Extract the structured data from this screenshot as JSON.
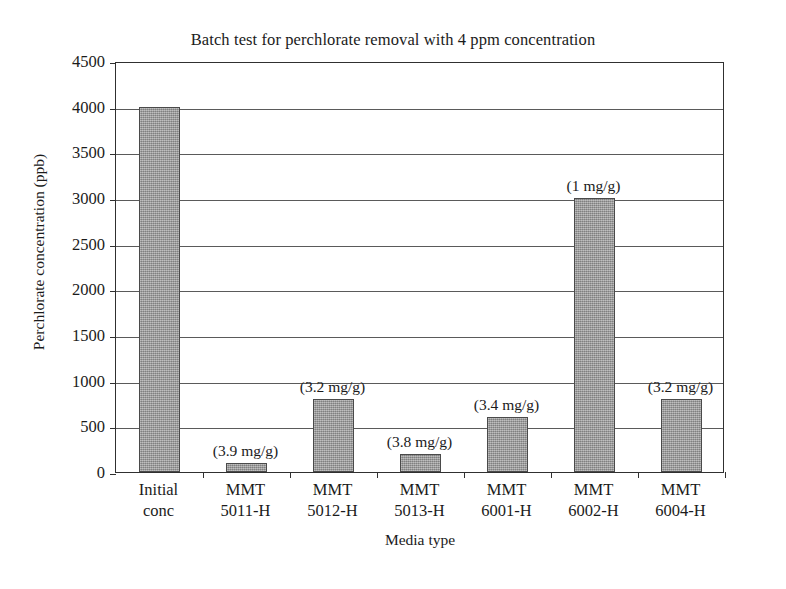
{
  "chart_data": {
    "type": "bar",
    "title": "Batch test for perchlorate removal with 4 ppm concentration",
    "xlabel": "Media type",
    "ylabel": "Perchlorate concentration (ppb)",
    "categories": [
      "Initial\nconc",
      "MMT\n5011-H",
      "MMT\n5012-H",
      "MMT\n5013-H",
      "MMT\n6001-H",
      "MMT\n6002-H",
      "MMT\n6004-H"
    ],
    "values": [
      4000,
      100,
      800,
      200,
      600,
      3000,
      800
    ],
    "annotations": [
      "",
      "(3.9 mg/g)",
      "(3.2 mg/g)",
      "(3.8 mg/g)",
      "(3.4 mg/g)",
      "(1 mg/g)",
      "(3.2 mg/g)"
    ],
    "ylim": [
      0,
      4500
    ],
    "ytick_labels": [
      "4500",
      "4000",
      "3500",
      "3000",
      "2500",
      "2000",
      "1500",
      "1000",
      "500",
      "0"
    ],
    "ytick_values": [
      4500,
      4000,
      3500,
      3000,
      2500,
      2000,
      1500,
      1000,
      500,
      0
    ],
    "grid": true,
    "legend": "none",
    "bar_color": "#9a9a9a",
    "bar_edge_color": "#4a4a4a",
    "axis_color": "#303030",
    "background_color": "#ffffff"
  }
}
